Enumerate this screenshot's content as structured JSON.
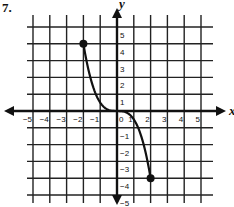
{
  "problem": {
    "number": "7."
  },
  "chart_data": {
    "type": "line",
    "title": "",
    "xlabel": "x",
    "ylabel": "y",
    "xlim": [
      -5,
      5
    ],
    "ylim": [
      -5,
      5
    ],
    "grid": true,
    "legend": null,
    "x_ticks": [
      "-5",
      "-4",
      "-3",
      "-2",
      "-1",
      "0",
      "1",
      "2",
      "3",
      "4",
      "5"
    ],
    "y_ticks": [
      "5",
      "4",
      "3",
      "2",
      "1",
      "-1",
      "-2",
      "-3",
      "-4",
      "-5"
    ],
    "series": [
      {
        "name": "curve",
        "function": "y = -x^3/2",
        "x": [
          -2,
          -1.5,
          -1,
          -0.5,
          0,
          0.5,
          1,
          1.5,
          2
        ],
        "y": [
          4,
          1.69,
          0.5,
          0.06,
          0,
          -0.06,
          -0.5,
          -1.69,
          -4
        ],
        "endpoints": [
          {
            "x": -2,
            "y": 4,
            "style": "closed"
          },
          {
            "x": 2,
            "y": -4,
            "style": "closed"
          }
        ]
      }
    ],
    "axis_arrows": true
  },
  "colors": {
    "ink": "#111111",
    "grid": "#222222",
    "background": "#ffffff"
  }
}
